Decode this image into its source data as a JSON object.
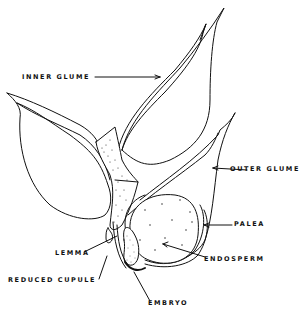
{
  "diagram": {
    "labels": {
      "inner_glume": "INNER GLUME",
      "outer_glume": "OUTER GLUME",
      "palea": "PALEA",
      "endosperm": "ENDOSPERM",
      "lemma": "LEMMA",
      "reduced_cupule": "REDUCED CUPULE",
      "embryo": "EMBRYO"
    },
    "colors": {
      "ink": "#111111",
      "background": "#ffffff"
    }
  }
}
